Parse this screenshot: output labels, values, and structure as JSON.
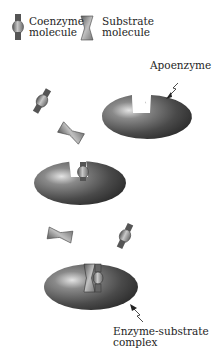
{
  "legend": {
    "coenzyme": {
      "line1": "Coenzyme",
      "line2": "molecule",
      "icon": "coenzyme-icon"
    },
    "substrate": {
      "line1": "Substrate",
      "line2": "molecule",
      "icon": "substrate-icon"
    }
  },
  "labels": {
    "apoenzyme": "Apoenzyme",
    "complex_line1": "Enzyme-substrate",
    "complex_line2": "complex"
  },
  "colors": {
    "enzyme_dark": "#3a3a3a",
    "enzyme_mid": "#6a6a6a",
    "enzyme_highlight": "#d8d8d8",
    "molecule_fill": "#9a9a9a",
    "molecule_dark": "#4a4a4a"
  }
}
